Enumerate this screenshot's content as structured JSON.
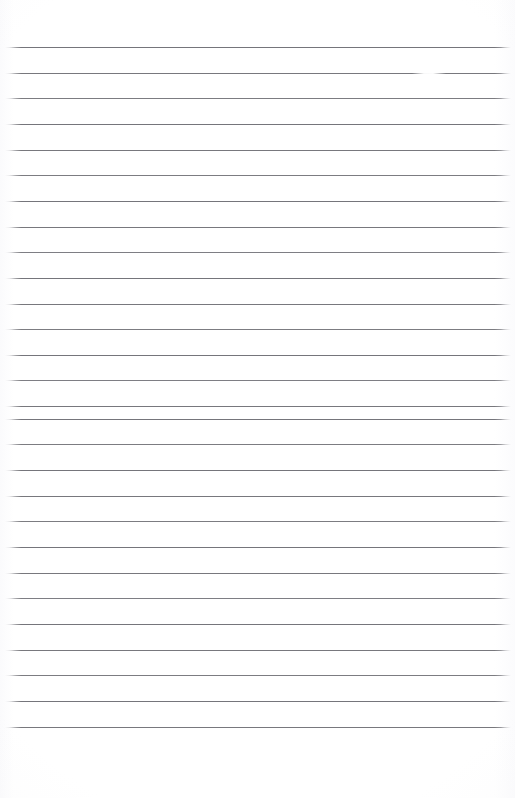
{
  "document": {
    "kind": "scanned-ruled-paper",
    "title": "Blank ruled notebook page",
    "page_width": 515,
    "page_height": 798,
    "background_color": "#ffffff",
    "rule_color": "#6a6a70",
    "text_content": "",
    "visible_text": [],
    "ruling": {
      "line_count": 28,
      "first_line_y": 47,
      "line_spacing": 25.65,
      "line_start_x": 5,
      "line_end_x": 511,
      "line_thickness": 1,
      "top_margin": 47,
      "bottom_margin": 63,
      "left_margin": 5,
      "right_margin": 4,
      "margin_rule_present": false
    },
    "lines": [
      {
        "index": 1,
        "y": 47,
        "x1": 5,
        "x2": 511,
        "opacity": 0.92
      },
      {
        "index": 2,
        "y": 73,
        "x1": 5,
        "x2": 511,
        "opacity": 0.9
      },
      {
        "index": 3,
        "y": 98,
        "x1": 5,
        "x2": 511,
        "opacity": 0.88
      },
      {
        "index": 4,
        "y": 124,
        "x1": 5,
        "x2": 511,
        "opacity": 0.92
      },
      {
        "index": 5,
        "y": 150,
        "x1": 5,
        "x2": 511,
        "opacity": 0.9
      },
      {
        "index": 6,
        "y": 175,
        "x1": 5,
        "x2": 511,
        "opacity": 0.88
      },
      {
        "index": 7,
        "y": 201,
        "x1": 5,
        "x2": 511,
        "opacity": 0.92
      },
      {
        "index": 8,
        "y": 227,
        "x1": 5,
        "x2": 511,
        "opacity": 0.9
      },
      {
        "index": 9,
        "y": 252,
        "x1": 5,
        "x2": 511,
        "opacity": 0.86
      },
      {
        "index": 10,
        "y": 278,
        "x1": 5,
        "x2": 511,
        "opacity": 0.92
      },
      {
        "index": 11,
        "y": 304,
        "x1": 5,
        "x2": 511,
        "opacity": 0.9
      },
      {
        "index": 12,
        "y": 329,
        "x1": 5,
        "x2": 511,
        "opacity": 0.88
      },
      {
        "index": 13,
        "y": 355,
        "x1": 5,
        "x2": 511,
        "opacity": 0.92
      },
      {
        "index": 14,
        "y": 380,
        "x1": 5,
        "x2": 511,
        "opacity": 0.86
      },
      {
        "index": 15,
        "y": 393,
        "x1": 5,
        "x2": 511,
        "opacity": 0.0
      },
      {
        "index": 16,
        "y": 406,
        "x1": 5,
        "x2": 511,
        "opacity": 0.9
      },
      {
        "index": 17,
        "y": 419,
        "x1": 5,
        "x2": 511,
        "opacity": 0.92
      },
      {
        "index": 18,
        "y": 444,
        "x1": 5,
        "x2": 511,
        "opacity": 0.88
      },
      {
        "index": 19,
        "y": 470,
        "x1": 5,
        "x2": 511,
        "opacity": 0.92
      },
      {
        "index": 20,
        "y": 496,
        "x1": 5,
        "x2": 511,
        "opacity": 0.9
      },
      {
        "index": 21,
        "y": 521,
        "x1": 5,
        "x2": 511,
        "opacity": 0.88
      },
      {
        "index": 22,
        "y": 547,
        "x1": 5,
        "x2": 511,
        "opacity": 0.92
      },
      {
        "index": 23,
        "y": 573,
        "x1": 5,
        "x2": 511,
        "opacity": 0.9
      },
      {
        "index": 24,
        "y": 598,
        "x1": 5,
        "x2": 511,
        "opacity": 0.86
      },
      {
        "index": 25,
        "y": 624,
        "x1": 5,
        "x2": 511,
        "opacity": 0.92
      },
      {
        "index": 26,
        "y": 650,
        "x1": 5,
        "x2": 511,
        "opacity": 0.9
      },
      {
        "index": 27,
        "y": 675,
        "x1": 5,
        "x2": 511,
        "opacity": 0.88
      },
      {
        "index": 28,
        "y": 701,
        "x1": 5,
        "x2": 511,
        "opacity": 0.92
      },
      {
        "index": 29,
        "y": 727,
        "x1": 5,
        "x2": 511,
        "opacity": 0.9
      },
      {
        "index": 30,
        "y": 735,
        "x1": 5,
        "x2": 511,
        "opacity": 0.0
      }
    ],
    "artifacts": [
      {
        "type": "faded-gap",
        "on_line": 2,
        "y": 73,
        "x": 412,
        "width": 34
      }
    ]
  }
}
